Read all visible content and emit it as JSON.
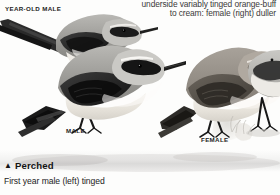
{
  "plate": {
    "title_note_line1": "underside variably tinged orange-buff",
    "title_note_line2": "to cream: female (right) duller",
    "labels": {
      "year_old_male": "YEAR-OLD MALE",
      "male": "MALE",
      "female": "FEMALE"
    },
    "footer": {
      "marker": "▲",
      "heading": "Perched",
      "caption": "First year male (left) tinged"
    },
    "colors": {
      "background": "#fdfdfc",
      "text_dark": "#141414",
      "text_note": "#3a3a3a",
      "plumage_dark": "#2b2b2b",
      "plumage_mid": "#8d8d8a",
      "plumage_light": "#e9e7e2",
      "ground": "#b9b9b6"
    }
  }
}
